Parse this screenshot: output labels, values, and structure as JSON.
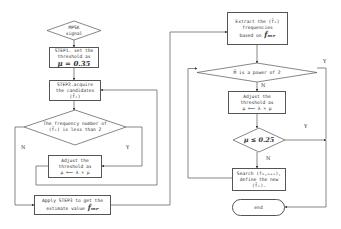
{
  "diagram": {
    "type": "flowchart",
    "nodes": {
      "start": {
        "line1": "MPSK",
        "line2": "signal"
      },
      "step1": {
        "line1": "STEP1. set the",
        "line2": "threshold as",
        "math": "μ = 0.35"
      },
      "step2": {
        "line1": "STEP2.acquire",
        "line2": "the candidates",
        "line3": "(f̃ᵢ)"
      },
      "decision_freq": {
        "line1": "The frequency number of",
        "line2": "(f̃ᵢ) is less than 2"
      },
      "adjust_left": {
        "line1": "Adjust the",
        "line2": "threshold as",
        "line3": "μ ⟸ λ × μ"
      },
      "step3": {
        "line1": "Apply STEP3 to get the",
        "line2": "estimate value",
        "math": "f̂ₘₑ"
      },
      "extract": {
        "line1": "Extract the (f̃ᵢ)",
        "line2": "frequencies",
        "line3": "based on",
        "math": "f̂ₘₑ"
      },
      "decision_power": {
        "line1": "M̃ is a power of 2"
      },
      "adjust_right": {
        "line1": "Adjust the",
        "line2": "threshold as",
        "line3": "μ ⟸ λ × μ"
      },
      "decision_mu": {
        "math": "μ ≤ 0.25"
      },
      "search": {
        "line1": "Search (fₘ,ₘₐₓ),",
        "line2": "define the new",
        "line3": "(f̃ᵢ)."
      },
      "end": {
        "line1": "end"
      }
    },
    "edge_labels": {
      "freq_no": "N",
      "freq_yes": "Y",
      "power_yes": "Y",
      "power_no": "N",
      "mu_yes": "Y",
      "mu_no": "N"
    }
  }
}
